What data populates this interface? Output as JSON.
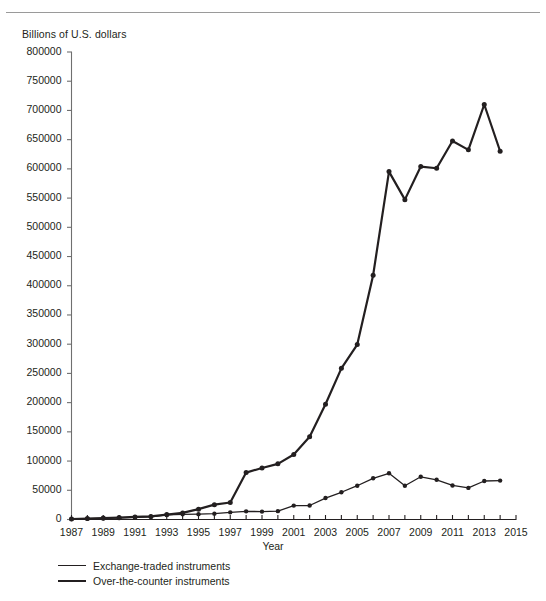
{
  "header": {
    "y_axis_unit_label": "Billions of U.S. dollars"
  },
  "axis_titles": {
    "x": "Year"
  },
  "legend": {
    "items": [
      {
        "label": "Exchange-traded instruments",
        "style": "thin",
        "color": "#231f20"
      },
      {
        "label": "Over-the-counter instruments",
        "style": "thick",
        "color": "#231f20"
      }
    ]
  },
  "chart_data": {
    "type": "line",
    "title": "",
    "subtitle": "",
    "xlabel": "Year",
    "ylabel": "Billions of U.S. dollars",
    "xlim": [
      1987,
      2015
    ],
    "ylim": [
      0,
      800000
    ],
    "grid": false,
    "legend_position": "below-plot-left",
    "y_ticks": [
      0,
      50000,
      100000,
      150000,
      200000,
      250000,
      300000,
      350000,
      400000,
      450000,
      500000,
      550000,
      600000,
      650000,
      700000,
      750000,
      800000
    ],
    "y_tick_labels": [
      "0",
      "50000",
      "100000",
      "150000",
      "200000",
      "250000",
      "300000",
      "350000",
      "400000",
      "450000",
      "500000",
      "550000",
      "600000",
      "650000",
      "700000",
      "750000",
      "800000"
    ],
    "x_ticks": [
      1987,
      1988,
      1989,
      1990,
      1991,
      1992,
      1993,
      1994,
      1995,
      1996,
      1997,
      1998,
      1999,
      2000,
      2001,
      2002,
      2003,
      2004,
      2005,
      2006,
      2007,
      2008,
      2009,
      2010,
      2011,
      2012,
      2013,
      2014,
      2015
    ],
    "x_tick_labels_shown": [
      "1987",
      "1989",
      "1991",
      "1993",
      "1995",
      "1997",
      "1999",
      "2001",
      "2003",
      "2005",
      "2007",
      "2009",
      "2011",
      "2013",
      "2015"
    ],
    "series": [
      {
        "name": "Exchange-traded instruments",
        "color": "#231f20",
        "line_width": 1.3,
        "marker": "circle",
        "x": [
          1987,
          1988,
          1989,
          1990,
          1991,
          1992,
          1993,
          1994,
          1995,
          1996,
          1997,
          1998,
          1999,
          2000,
          2001,
          2002,
          2003,
          2004,
          2005,
          2006,
          2007,
          2008,
          2009,
          2010,
          2011,
          2012,
          2013,
          2014
        ],
        "values": [
          730,
          1300,
          1770,
          2290,
          3520,
          4640,
          7770,
          8860,
          9190,
          10020,
          12200,
          13930,
          13520,
          14300,
          23800,
          23900,
          36700,
          46600,
          57800,
          70500,
          79100,
          57800,
          73100,
          67900,
          58300,
          54100,
          65900,
          66600
        ]
      },
      {
        "name": "Over-the-counter instruments",
        "color": "#231f20",
        "line_width": 2.2,
        "marker": "circle",
        "x": [
          1987,
          1988,
          1989,
          1990,
          1991,
          1992,
          1993,
          1994,
          1995,
          1996,
          1997,
          1998,
          1999,
          2000,
          2001,
          2002,
          2003,
          2004,
          2005,
          2006,
          2007,
          2008,
          2009,
          2010,
          2011,
          2012,
          2013,
          2014
        ],
        "values": [
          866,
          1654,
          2474,
          3451,
          4449,
          5346,
          8475,
          11303,
          17713,
          25453,
          29035,
          80309,
          88202,
          95200,
          111178,
          141679,
          197167,
          258628,
          299261,
          418131,
          595341,
          547371,
          603900,
          601048,
          647811,
          632579,
          710182,
          630150
        ]
      }
    ],
    "notable_points": {
      "otc_peak": {
        "year": 2013,
        "value": 710182
      },
      "otc_last": {
        "year": 2014,
        "value": 630150
      },
      "exchange_peak": {
        "year": 2007,
        "value": 79100
      }
    }
  }
}
